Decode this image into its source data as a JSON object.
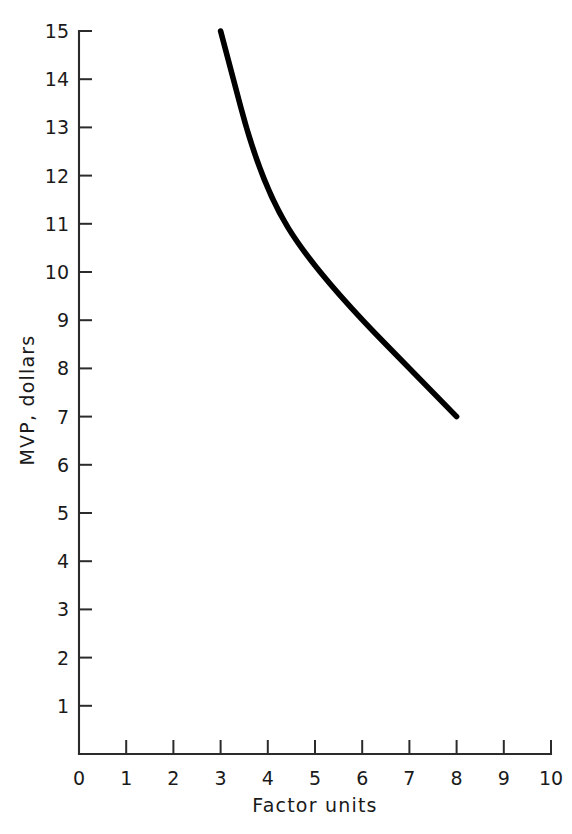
{
  "chart_data": {
    "type": "line",
    "title": "",
    "xlabel": "Factor units",
    "ylabel": "MVP, dollars",
    "xlim": [
      0,
      10
    ],
    "ylim": [
      0,
      15
    ],
    "grid": false,
    "legend": null,
    "xticks": [
      "0",
      "1",
      "2",
      "3",
      "4",
      "5",
      "6",
      "7",
      "8",
      "9",
      "10"
    ],
    "xtick_values": [
      0,
      1,
      2,
      3,
      4,
      5,
      6,
      7,
      8,
      9,
      10
    ],
    "yticks": [
      "1",
      "2",
      "3",
      "4",
      "5",
      "6",
      "7",
      "8",
      "9",
      "10",
      "11",
      "12",
      "13",
      "14",
      "15"
    ],
    "ytick_values": [
      1,
      2,
      3,
      4,
      5,
      6,
      7,
      8,
      9,
      10,
      11,
      12,
      13,
      14,
      15
    ],
    "series": [
      {
        "name": "MVP",
        "color": "#000000",
        "x": [
          3.0,
          3.85,
          5.0,
          8.0
        ],
        "y": [
          15.0,
          11.85,
          10.0,
          7.0
        ]
      }
    ]
  },
  "axes": {
    "x_axis_name": "Factor units",
    "y_axis_name": "MVP, dollars"
  },
  "colors": {
    "line": "#000000",
    "axis": "#2b2b2b",
    "text": "#1a1a1a",
    "background": "#ffffff"
  }
}
